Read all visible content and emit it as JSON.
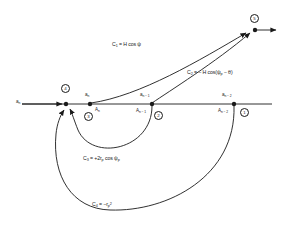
{
  "diagram": {
    "type": "signal flow graph",
    "stroke_color": "#1a1a1a",
    "background": "#ffffff",
    "input": {
      "label": "a",
      "sub": "n"
    },
    "nodes": [
      {
        "id": "5",
        "circle_label": "5",
        "x": 255,
        "y": 30,
        "top_label": "",
        "top_sub": "",
        "bottom_label": "",
        "bottom_sub": ""
      },
      {
        "id": "4",
        "circle_label": "4",
        "x": 66,
        "y": 104,
        "top_label": "",
        "top_sub": "",
        "bottom_label": "",
        "bottom_sub": ""
      },
      {
        "id": "3",
        "circle_label": "3",
        "x": 90,
        "y": 104,
        "top_label": "a",
        "top_sub": "n",
        "bottom_label": "A",
        "bottom_sub": "n"
      },
      {
        "id": "2",
        "circle_label": "2",
        "x": 152,
        "y": 104,
        "top_label": "a",
        "top_sub": "n − 1",
        "bottom_label": "A",
        "bottom_sub": "n − 1"
      },
      {
        "id": "1",
        "circle_label": "1",
        "x": 234,
        "y": 104,
        "top_label": "a",
        "top_sub": "n − 2",
        "bottom_label": "A",
        "bottom_sub": "n − 2"
      }
    ],
    "branches": [
      {
        "id": "C1",
        "from": "3",
        "to": "5",
        "label_prefix": "C",
        "label_sub": "1",
        "label_expr": " = H cos ψ",
        "label_x": 112,
        "label_y": 42
      },
      {
        "id": "C2",
        "from": "2",
        "to": "5",
        "label_prefix": "C",
        "label_sub": "2",
        "label_expr": " = − H cos(ψ",
        "label_expr_sub": "p",
        "label_expr_tail": " − θ)",
        "label_x": 187,
        "label_y": 70
      },
      {
        "id": "C3",
        "from": "2",
        "to": "4",
        "label_prefix": "C",
        "label_sub": "3",
        "label_expr": " = +2r",
        "label_expr_sub": "p",
        "label_expr_tail": " cos ψ",
        "label_expr_sub2": "p",
        "label_x": 83,
        "label_y": 156
      },
      {
        "id": "C4",
        "from": "1",
        "to": "4",
        "label_prefix": "C",
        "label_sub": "4",
        "label_expr": " = −r",
        "label_expr_sub": "p",
        "label_expr_sup": "2",
        "label_x": 92,
        "label_y": 202
      }
    ],
    "axis": {
      "y": 104,
      "x_start": 22,
      "x_end": 272
    }
  }
}
